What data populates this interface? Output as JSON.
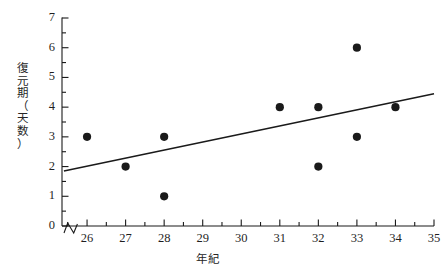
{
  "chart_data": {
    "type": "scatter",
    "title": "",
    "xlabel": "年紀",
    "ylabel": "復元期（天数）",
    "ylabel_chars": [
      "復",
      "元",
      "期",
      "（",
      "天",
      "数",
      "）"
    ],
    "xlim": [
      25.35,
      35
    ],
    "ylim": [
      0,
      7
    ],
    "x_ticks": [
      26,
      27,
      28,
      29,
      30,
      31,
      32,
      33,
      34,
      35
    ],
    "y_ticks": [
      0,
      1,
      2,
      3,
      4,
      5,
      6,
      7
    ],
    "x_minor_tick_step": 0.5,
    "y_minor_tick_step": 0.5,
    "grid": false,
    "legend": "none",
    "axis_break": true,
    "axis_break_note": "zigzag break on x-axis between origin and 26",
    "marker": "filled-circle",
    "marker_color": "#1a1a1a",
    "line_color": "#1a1a1a",
    "points": [
      {
        "x": 26,
        "y": 3
      },
      {
        "x": 27,
        "y": 2
      },
      {
        "x": 28,
        "y": 3
      },
      {
        "x": 28,
        "y": 1
      },
      {
        "x": 31,
        "y": 4
      },
      {
        "x": 32,
        "y": 4
      },
      {
        "x": 32,
        "y": 2
      },
      {
        "x": 33,
        "y": 6
      },
      {
        "x": 33,
        "y": 3
      },
      {
        "x": 34,
        "y": 4
      }
    ],
    "trendline": {
      "type": "linear-fit",
      "x_start": 25.4,
      "y_start": 1.85,
      "x_end": 35,
      "y_end": 4.45
    }
  },
  "axis_labels": {
    "y": [
      "0",
      "1",
      "2",
      "3",
      "4",
      "5",
      "6",
      "7"
    ],
    "x": [
      "26",
      "27",
      "28",
      "29",
      "30",
      "31",
      "32",
      "33",
      "34",
      "35"
    ]
  }
}
